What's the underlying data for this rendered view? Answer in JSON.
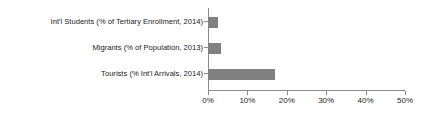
{
  "chart_data": {
    "type": "bar",
    "orientation": "horizontal",
    "title": "",
    "xlabel": "",
    "ylabel": "",
    "categories": [
      "Int'l Students (% of Tertiary Enrollment, 2014)",
      "Migrants (% of Population, 2013)",
      "Tourists (% Int'l Arrivals, 2014)"
    ],
    "values": [
      2.5,
      3.3,
      17.0
    ],
    "xlim": [
      0,
      50
    ],
    "xticks": [
      0,
      10,
      20,
      30,
      40,
      50
    ],
    "xtick_labels": [
      "0%",
      "10%",
      "20%",
      "30%",
      "40%",
      "50%"
    ],
    "grid": false,
    "legend": false,
    "bar_color": "#808080",
    "axis_color": "#8c8c8c",
    "text_color": "#232323",
    "background_color": "#ffffff"
  }
}
